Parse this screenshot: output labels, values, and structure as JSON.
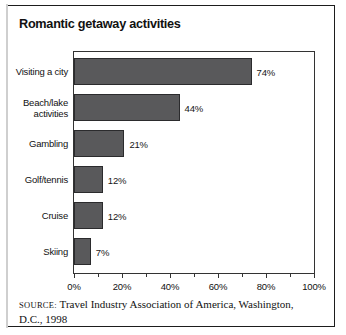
{
  "figure": {
    "title": "Romantic getaway activities",
    "source_label": "Source:",
    "source_text": "Travel Industry Association of America, Washington, D.C., 1998"
  },
  "chart_data": {
    "type": "bar",
    "orientation": "horizontal",
    "title": "Romantic getaway activities",
    "xlabel": "",
    "ylabel": "",
    "xlim": [
      0,
      100
    ],
    "grid": false,
    "legend": "none",
    "bar_color": "#59595b",
    "bar_edge_color": "#2b2b2d",
    "categories": [
      "Visiting a city",
      "Beach/lake\nactivities",
      "Gambling",
      "Golf/tennis",
      "Cruise",
      "Skiing"
    ],
    "values": [
      74,
      44,
      21,
      12,
      12,
      7
    ],
    "value_labels": [
      "74%",
      "44%",
      "21%",
      "12%",
      "12%",
      "7%"
    ],
    "xticks": [
      0,
      20,
      40,
      60,
      80,
      100
    ],
    "xtick_labels": [
      "0%",
      "20%",
      "40%",
      "60%",
      "80%",
      "100%"
    ],
    "minor_xticks": [
      10,
      30,
      50,
      70,
      90
    ]
  }
}
